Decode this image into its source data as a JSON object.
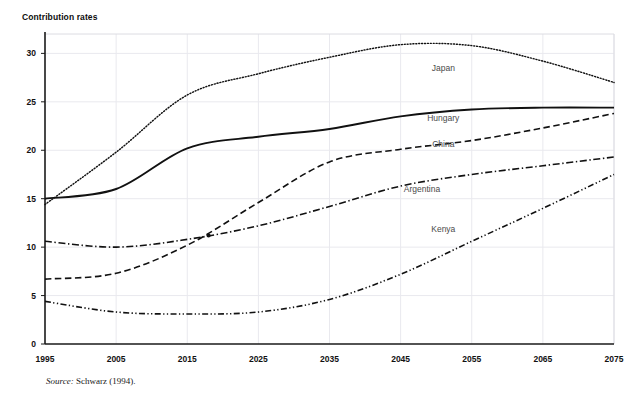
{
  "axis_title": "Contribution rates",
  "source": {
    "label": "Source:",
    "text": " Schwarz (1994)."
  },
  "colors": {
    "line": "#111111",
    "grid": "#e9e9ee",
    "axis": "#1a1a1a",
    "label": "#4a4a4a"
  },
  "chart_data": {
    "type": "line",
    "title": "Contribution rates",
    "xlabel": "",
    "ylabel": "Contribution rates",
    "xlim": [
      1995,
      2075
    ],
    "ylim": [
      0,
      32
    ],
    "grid": true,
    "legend_position": "inline-right-of-series",
    "yticks": [
      0,
      5,
      10,
      15,
      20,
      25,
      30
    ],
    "xticks": [
      1995,
      2005,
      2015,
      2025,
      2035,
      2045,
      2055,
      2065,
      2075
    ],
    "x": [
      1995,
      2005,
      2015,
      2025,
      2035,
      2045,
      2055,
      2065,
      2075
    ],
    "series": [
      {
        "name": "Japan",
        "style": "dotted",
        "values": [
          14.4,
          19.8,
          25.7,
          27.9,
          29.6,
          30.9,
          30.8,
          29.2,
          27.0
        ],
        "label_x": 2051,
        "label_y": 28.2
      },
      {
        "name": "Hungary",
        "style": "solid",
        "values": [
          15.0,
          16.0,
          20.2,
          21.4,
          22.2,
          23.5,
          24.2,
          24.4,
          24.4
        ],
        "label_x": 2051,
        "label_y": 23.0
      },
      {
        "name": "China",
        "style": "dashed",
        "values": [
          6.7,
          7.3,
          10.2,
          14.6,
          18.8,
          20.1,
          21.0,
          22.3,
          23.8
        ],
        "label_x": 2051,
        "label_y": 20.3
      },
      {
        "name": "Argentina",
        "style": "dashdot",
        "values": [
          10.6,
          10.0,
          10.8,
          12.2,
          14.2,
          16.3,
          17.5,
          18.4,
          19.3
        ],
        "label_x": 2048,
        "label_y": 15.7
      },
      {
        "name": "Kenya",
        "style": "dashdotdot",
        "values": [
          4.4,
          3.3,
          3.1,
          3.3,
          4.6,
          7.2,
          10.6,
          14.0,
          17.5
        ],
        "label_x": 2051,
        "label_y": 11.6
      }
    ],
    "markers": [
      {
        "x": 2018,
        "y": 11.2,
        "note": "China crosses Argentina"
      }
    ]
  }
}
